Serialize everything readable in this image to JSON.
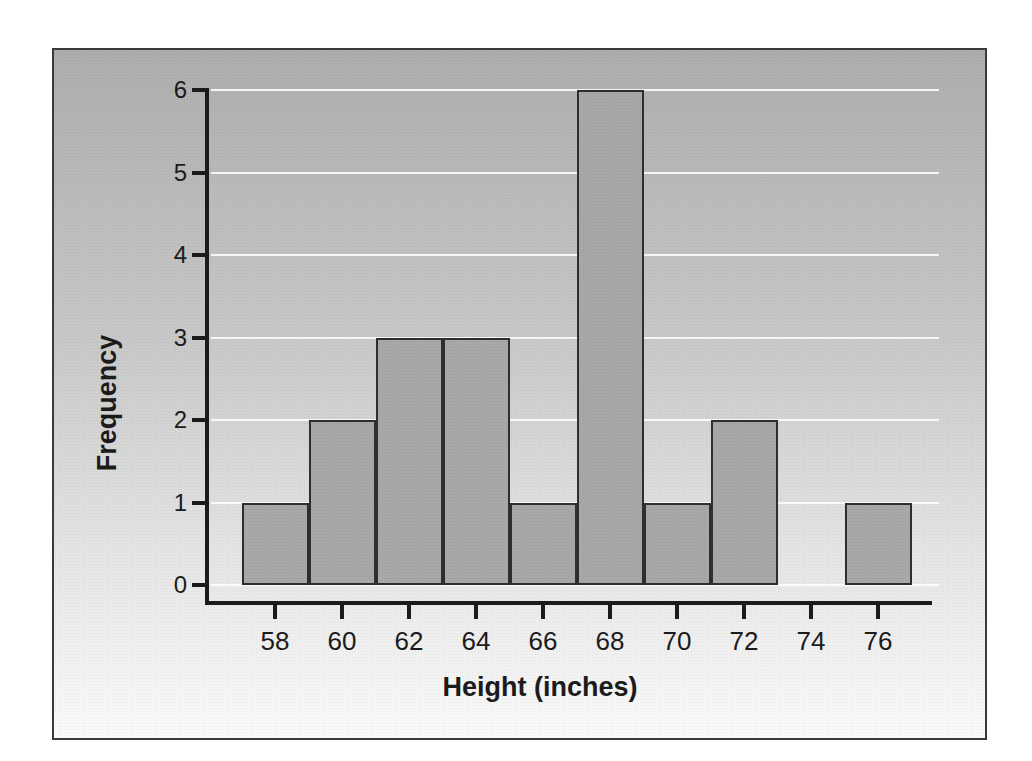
{
  "figure": {
    "frame_border_color": "#3a3a3a",
    "background_top": "#adadad",
    "background_bottom": "#fafafa",
    "gridline_color": "#ffffff",
    "axis_color": "#1b1b1b",
    "bar_fill": "#a8a8a8",
    "bar_border": "#2e2e2e",
    "text_color": "#1b1b1b"
  },
  "chart_data": {
    "type": "bar",
    "subtype": "histogram",
    "title": "",
    "xlabel": "Height (inches)",
    "ylabel": "Frequency",
    "bin_width": 2,
    "bin_edges": [
      57,
      59,
      61,
      63,
      65,
      67,
      69,
      71,
      73,
      75,
      77
    ],
    "bin_centers": [
      58,
      60,
      62,
      64,
      66,
      68,
      70,
      72,
      74,
      76
    ],
    "values": [
      1,
      2,
      3,
      3,
      1,
      6,
      1,
      2,
      0,
      1
    ],
    "x_ticks": [
      58,
      60,
      62,
      64,
      66,
      68,
      70,
      72,
      74,
      76
    ],
    "y_ticks": [
      0,
      1,
      2,
      3,
      4,
      5,
      6
    ],
    "xlim": [
      56,
      77.5
    ],
    "ylim": [
      0,
      6
    ],
    "grid": "horizontal white gridlines at integer frequencies",
    "legend": null
  }
}
